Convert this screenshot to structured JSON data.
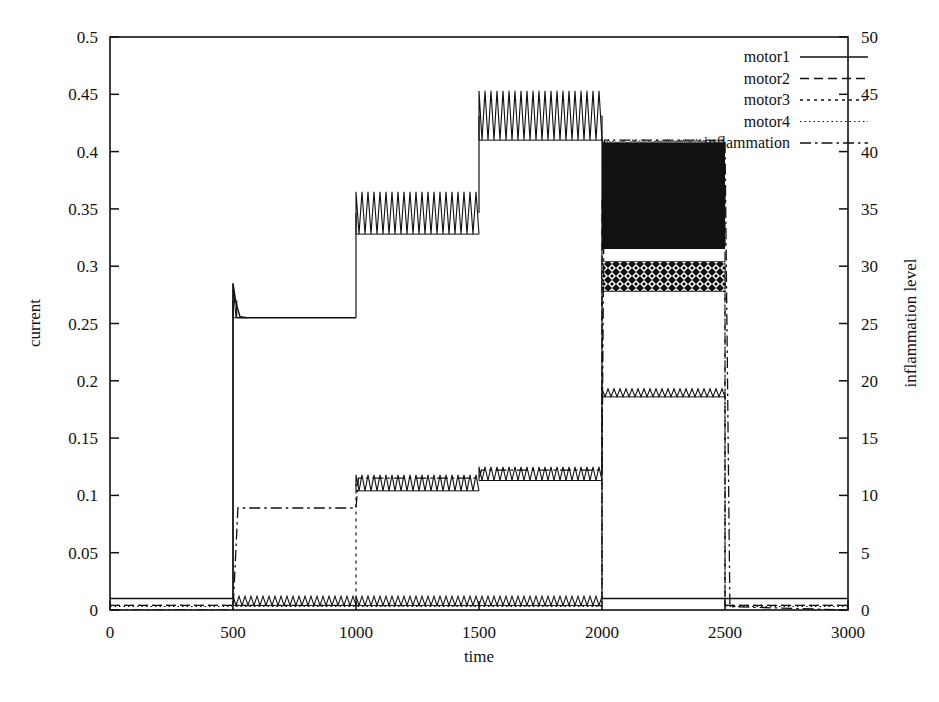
{
  "chart_data": {
    "type": "line",
    "title": "",
    "xlabel": "time",
    "ylabel": "current",
    "y2label": "inflammation level",
    "xlim": [
      0,
      3000
    ],
    "ylim": [
      0,
      0.5
    ],
    "y2lim": [
      0,
      50
    ],
    "xticks": [
      "0",
      "500",
      "1000",
      "1500",
      "2000",
      "2500",
      "3000"
    ],
    "xtick_values": [
      0,
      500,
      1000,
      1500,
      2000,
      2500,
      3000
    ],
    "yticks": [
      "0",
      "0.05",
      "0.1",
      "0.15",
      "0.2",
      "0.25",
      "0.3",
      "0.35",
      "0.4",
      "0.45",
      "0.5"
    ],
    "ytick_values": [
      0,
      0.05,
      0.1,
      0.15,
      0.2,
      0.25,
      0.3,
      0.35,
      0.4,
      0.45,
      0.5
    ],
    "y2ticks": [
      "0",
      "5",
      "10",
      "15",
      "20",
      "25",
      "30",
      "35",
      "40",
      "45",
      "50"
    ],
    "y2tick_values": [
      0,
      5,
      10,
      15,
      20,
      25,
      30,
      35,
      40,
      45,
      50
    ],
    "grid": false,
    "legend_position": "top-right",
    "legend": [
      {
        "name": "motor1",
        "dash": "solid"
      },
      {
        "name": "motor2",
        "dash": "dashed"
      },
      {
        "name": "motor3",
        "dash": "dotted"
      },
      {
        "name": "motor4",
        "dash": "fine-dotted"
      },
      {
        "name": "inflammation",
        "dash": "dash-dot"
      }
    ],
    "series": [
      {
        "name": "motor1",
        "axis": "left",
        "dash": "solid",
        "segments": [
          {
            "t0": 0,
            "t1": 500,
            "low": 0.01,
            "high": 0.01
          },
          {
            "t0": 500,
            "t1": 515,
            "low": 0.255,
            "high": 0.285
          },
          {
            "t0": 515,
            "t1": 1000,
            "low": 0.255,
            "high": 0.255
          },
          {
            "t0": 1000,
            "t1": 1500,
            "low": 0.328,
            "high": 0.365
          },
          {
            "t0": 1500,
            "t1": 2000,
            "low": 0.41,
            "high": 0.453
          },
          {
            "t0": 2000,
            "t1": 2500,
            "low": 0.01,
            "high": 0.01
          },
          {
            "t0": 2500,
            "t1": 3000,
            "low": 0.01,
            "high": 0.01
          }
        ]
      },
      {
        "name": "motor2",
        "axis": "left",
        "dash": "dashed",
        "segments": [
          {
            "t0": 0,
            "t1": 500,
            "low": 0.004,
            "high": 0.004
          },
          {
            "t0": 500,
            "t1": 1000,
            "low": 0.004,
            "high": 0.012
          },
          {
            "t0": 1000,
            "t1": 2000,
            "low": 0.004,
            "high": 0.012
          },
          {
            "t0": 2000,
            "t1": 2500,
            "low": 0.315,
            "high": 0.408
          },
          {
            "t0": 2500,
            "t1": 3000,
            "low": 0.004,
            "high": 0.004
          }
        ]
      },
      {
        "name": "motor3",
        "axis": "left",
        "dash": "dotted",
        "segments": [
          {
            "t0": 0,
            "t1": 1000,
            "low": 0.004,
            "high": 0.004
          },
          {
            "t0": 1000,
            "t1": 1500,
            "low": 0.104,
            "high": 0.118
          },
          {
            "t0": 1500,
            "t1": 2000,
            "low": 0.113,
            "high": 0.125
          },
          {
            "t0": 2000,
            "t1": 2500,
            "low": 0.278,
            "high": 0.304
          },
          {
            "t0": 2500,
            "t1": 3000,
            "low": 0.004,
            "high": 0.004
          }
        ]
      },
      {
        "name": "motor4",
        "axis": "left",
        "dash": "fine-dotted",
        "segments": [
          {
            "t0": 0,
            "t1": 2000,
            "low": 0.003,
            "high": 0.003
          },
          {
            "t0": 2000,
            "t1": 2500,
            "low": 0.186,
            "high": 0.193
          },
          {
            "t0": 2500,
            "t1": 3000,
            "low": 0.003,
            "high": 0.003
          }
        ]
      },
      {
        "name": "inflammation",
        "axis": "right",
        "dash": "dash-dot",
        "points": [
          {
            "t": 0,
            "v": 0.0
          },
          {
            "t": 500,
            "v": 0.0
          },
          {
            "t": 520,
            "v": 8.9
          },
          {
            "t": 1000,
            "v": 8.9
          },
          {
            "t": 1010,
            "v": 11.5
          },
          {
            "t": 1500,
            "v": 11.5
          },
          {
            "t": 1510,
            "v": 12.2
          },
          {
            "t": 2000,
            "v": 12.2
          },
          {
            "t": 2010,
            "v": 41.0
          },
          {
            "t": 2500,
            "v": 41.0
          },
          {
            "t": 2520,
            "v": 0.3
          },
          {
            "t": 3000,
            "v": 0.0
          }
        ]
      }
    ],
    "annotations": [
      {
        "text": "motor1 step plateau 0.255 from t=500 to t=1000"
      },
      {
        "text": "motor1 oscillating band 0.328-0.365 from t=1000 to t=1500"
      },
      {
        "text": "motor1 oscillating band 0.410-0.453 from t=1500 to t=2000"
      },
      {
        "text": "motor2 oscillating band 0.315-0.408 from t=2000 to t=2500"
      },
      {
        "text": "motor3 cross-hatched band 0.278-0.304 from t=2000 to t=2500"
      },
      {
        "text": "motor4 band near 0.19 from t=2000 to t=2500"
      }
    ]
  }
}
